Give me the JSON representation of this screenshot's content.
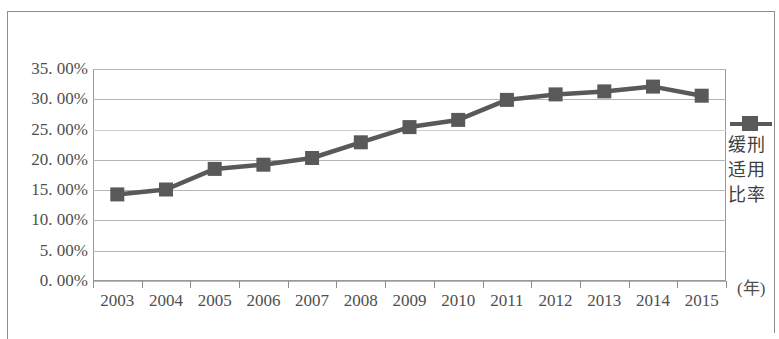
{
  "chart_data": {
    "type": "line",
    "title": "",
    "subtitle": "",
    "xlabel": "(年)",
    "ylabel": "",
    "categories": [
      "2003",
      "2004",
      "2005",
      "2006",
      "2007",
      "2008",
      "2009",
      "2010",
      "2011",
      "2012",
      "2013",
      "2014",
      "2015"
    ],
    "series": [
      {
        "name": "缓刑适用比率",
        "values": [
          14.3,
          15.1,
          18.5,
          19.2,
          20.3,
          22.9,
          25.4,
          26.6,
          29.9,
          30.8,
          31.3,
          32.1,
          30.6
        ]
      }
    ],
    "ylim": [
      0,
      35
    ],
    "y_tick_values": [
      0,
      5,
      10,
      15,
      20,
      25,
      30,
      35
    ],
    "y_tick_labels": [
      "0. 00%",
      "5. 00%",
      "10. 00%",
      "15. 00%",
      "20. 00%",
      "25. 00%",
      "30. 00%",
      "35. 00%"
    ],
    "grid": true,
    "grid_axis": "y",
    "legend_position": "right",
    "marker": "square",
    "series_color": "#595959",
    "grid_color": "#b5b5b5",
    "axis_color": "#9a9a9a",
    "text_color": "#4f4f4f"
  },
  "legend": {
    "marker_name": "line-square-marker",
    "label_lines": [
      "缓刑",
      "适用",
      "比率"
    ],
    "full_label": "缓刑适用比率"
  },
  "axes": {
    "x_unit": "(年)"
  }
}
